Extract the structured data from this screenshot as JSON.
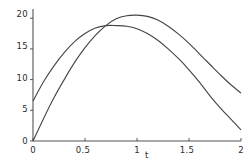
{
  "chart_data": {
    "type": "line",
    "title": "",
    "subtitle": "",
    "xlabel": "t",
    "ylabel": "",
    "xlim": [
      0,
      2
    ],
    "ylim": [
      0,
      21.5
    ],
    "grid": false,
    "legend": "none",
    "xticks": [
      0,
      0.5,
      1,
      1.5,
      2
    ],
    "xtick_labels": [
      "0",
      "0.5",
      "1",
      "1.5",
      "2"
    ],
    "yticks": [
      0,
      5,
      10,
      15,
      20
    ],
    "ytick_labels": [
      "0",
      "5",
      "10",
      "15",
      "20"
    ],
    "axis_color": "#555555",
    "curve_color": "#444444",
    "series": [
      {
        "name": "curve-upper-peak",
        "color": "#444444",
        "start_value": 0.0,
        "peak_x": 0.95,
        "peak_value": 20.5,
        "end_value": 7.8,
        "x": [
          0,
          0.1,
          0.2,
          0.3,
          0.4,
          0.5,
          0.6,
          0.7,
          0.8,
          0.9,
          1.0,
          1.1,
          1.2,
          1.3,
          1.4,
          1.5,
          1.6,
          1.7,
          1.8,
          1.9,
          2.0
        ],
        "y": [
          0.0,
          3.6,
          7.0,
          10.0,
          12.8,
          15.2,
          17.2,
          18.8,
          19.9,
          20.4,
          20.5,
          20.3,
          19.7,
          18.7,
          17.4,
          15.9,
          14.2,
          12.5,
          10.8,
          9.2,
          7.8
        ]
      },
      {
        "name": "curve-lower-peak",
        "color": "#444444",
        "start_value": 6.5,
        "peak_x": 0.85,
        "peak_value": 18.8,
        "end_value": 1.8,
        "x": [
          0,
          0.1,
          0.2,
          0.3,
          0.4,
          0.5,
          0.6,
          0.7,
          0.8,
          0.9,
          1.0,
          1.1,
          1.2,
          1.3,
          1.4,
          1.5,
          1.6,
          1.7,
          1.8,
          1.9,
          2.0
        ],
        "y": [
          6.5,
          9.6,
          12.2,
          14.4,
          16.2,
          17.5,
          18.4,
          18.8,
          18.8,
          18.7,
          18.3,
          17.5,
          16.4,
          15.0,
          13.4,
          11.6,
          9.6,
          7.4,
          5.4,
          3.6,
          1.8
        ]
      }
    ],
    "annotations": {
      "intersection_x": 0.62,
      "intersection_y": 18.1
    }
  },
  "labels": {
    "xticks": [
      "0",
      "0.5",
      "1",
      "1.5",
      "2"
    ],
    "yticks": [
      "0",
      "5",
      "10",
      "15",
      "20"
    ],
    "xaxis_title": "t"
  }
}
